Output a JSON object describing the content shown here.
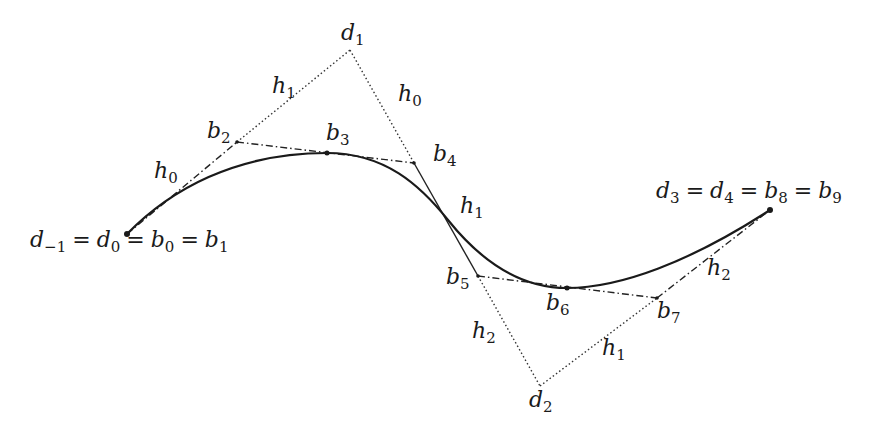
{
  "diagram": {
    "title": "",
    "colors": {
      "curve": "#1a1a1a",
      "control_polygon": "#333333",
      "bezier_polygon": "#222222",
      "background": "#ffffff"
    },
    "points": {
      "d0": {
        "x": 127,
        "y": 234
      },
      "b2": {
        "x": 237,
        "y": 142
      },
      "d1": {
        "x": 350,
        "y": 50
      },
      "b3": {
        "x": 327,
        "y": 153
      },
      "b4": {
        "x": 414,
        "y": 163
      },
      "junction": {
        "x": 448,
        "y": 220
      },
      "b5": {
        "x": 478,
        "y": 276
      },
      "b6": {
        "x": 567,
        "y": 288
      },
      "b7": {
        "x": 657,
        "y": 298
      },
      "d2": {
        "x": 540,
        "y": 386
      },
      "d3": {
        "x": 770,
        "y": 210
      }
    },
    "labels": {
      "d1": {
        "base": "d",
        "sub": "1"
      },
      "d2": {
        "base": "d",
        "sub": "2"
      },
      "b2": {
        "base": "b",
        "sub": "2"
      },
      "b3": {
        "base": "b",
        "sub": "3"
      },
      "b4": {
        "base": "b",
        "sub": "4"
      },
      "b5": {
        "base": "b",
        "sub": "5"
      },
      "b6": {
        "base": "b",
        "sub": "6"
      },
      "b7": {
        "base": "b",
        "sub": "7"
      },
      "h0_left": {
        "base": "h",
        "sub": "0"
      },
      "h1_upper": {
        "base": "h",
        "sub": "1"
      },
      "h0_upper_right": {
        "base": "h",
        "sub": "0"
      },
      "h1_mid": {
        "base": "h",
        "sub": "1"
      },
      "h2_lower_left": {
        "base": "h",
        "sub": "2"
      },
      "h1_lower": {
        "base": "h",
        "sub": "1"
      },
      "h2_right": {
        "base": "h",
        "sub": "2"
      },
      "start_equation": {
        "terms": [
          {
            "base": "d",
            "sub": "−1"
          },
          {
            "base": "d",
            "sub": "0"
          },
          {
            "base": "b",
            "sub": "0"
          },
          {
            "base": "b",
            "sub": "1"
          }
        ],
        "separator": "="
      },
      "end_equation": {
        "terms": [
          {
            "base": "d",
            "sub": "3"
          },
          {
            "base": "d",
            "sub": "4"
          },
          {
            "base": "b",
            "sub": "8"
          },
          {
            "base": "b",
            "sub": "9"
          }
        ],
        "separator": "="
      }
    }
  }
}
